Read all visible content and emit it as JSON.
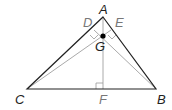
{
  "diagram": {
    "type": "triangle-orthocenter",
    "points": {
      "A": {
        "label": "A",
        "x": 103,
        "y": 17,
        "color": "#222222"
      },
      "B": {
        "label": "B",
        "x": 156,
        "y": 89,
        "color": "#222222"
      },
      "C": {
        "label": "C",
        "x": 27,
        "y": 89,
        "color": "#222222"
      },
      "D": {
        "label": "D",
        "x": 93,
        "y": 30,
        "color": "#777777"
      },
      "E": {
        "label": "E",
        "x": 112,
        "y": 29,
        "color": "#777777"
      },
      "F": {
        "label": "F",
        "x": 103,
        "y": 89,
        "color": "#777777"
      },
      "G": {
        "label": "G",
        "x": 103,
        "y": 36,
        "color": "#222222"
      }
    },
    "sides": [
      "AB",
      "BC",
      "CA"
    ],
    "altitudes": [
      "AF",
      "BD",
      "CE"
    ],
    "right_angles": [
      "D",
      "E",
      "F"
    ],
    "colors": {
      "sides": "#222222",
      "altitudes": "#aaaaaa",
      "point": "#000000"
    }
  }
}
